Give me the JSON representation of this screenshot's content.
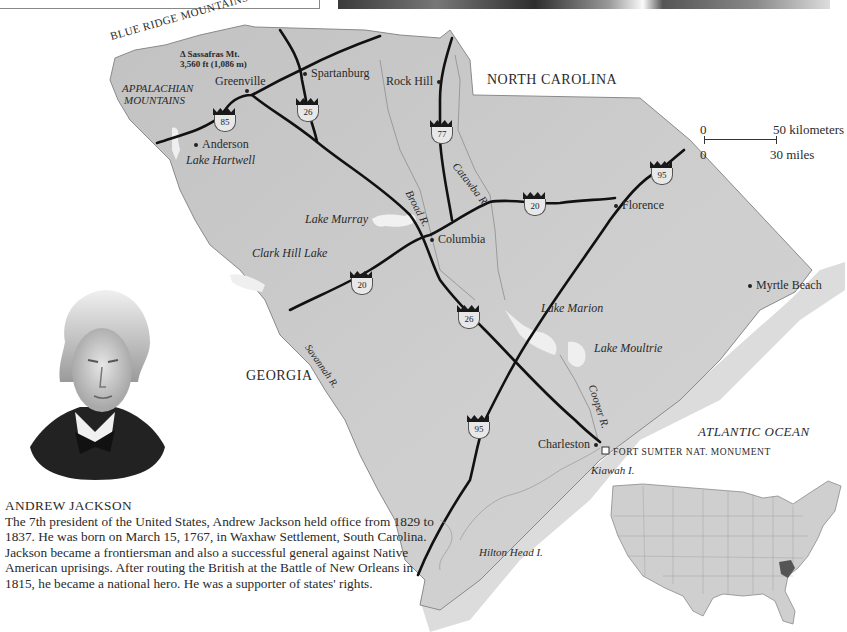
{
  "page": {
    "type": "atlas-map-page",
    "subject": "South Carolina"
  },
  "map": {
    "regions": {
      "north_carolina": "NORTH CAROLINA",
      "georgia": "GEORGIA",
      "atlantic_ocean": "ATLANTIC OCEAN"
    },
    "mountains": {
      "blue_ridge": "BLUE RIDGE MOUNTAINS",
      "appalachian_line1": "APPALACHIAN",
      "appalachian_line2": "MOUNTAINS",
      "peak_line1": "Δ Sassafras Mt.",
      "peak_line2": "3,560 ft (1,086 m)"
    },
    "cities": [
      {
        "name": "Greenville"
      },
      {
        "name": "Spartanburg"
      },
      {
        "name": "Rock Hill"
      },
      {
        "name": "Anderson"
      },
      {
        "name": "Columbia",
        "capital": true
      },
      {
        "name": "Florence"
      },
      {
        "name": "Myrtle Beach"
      },
      {
        "name": "Charleston"
      }
    ],
    "water": {
      "lake_hartwell": "Lake Hartwell",
      "lake_murray": "Lake Murray",
      "clark_hill_lake": "Clark Hill Lake",
      "lake_marion": "Lake Marion",
      "lake_moultrie": "Lake Moultrie",
      "catawba_river": "Catawba R.",
      "broad_river": "Broad R.",
      "savannah_river": "Savannah R.",
      "cooper_river": "Cooper R."
    },
    "islands": {
      "kiawah": "Kiawah I.",
      "hilton_head": "Hilton Head I."
    },
    "landmarks": {
      "fort_sumter": "FORT SUMTER NAT. MONUMENT"
    },
    "interstates": [
      {
        "id": "i85",
        "number": "85"
      },
      {
        "id": "i26a",
        "number": "26"
      },
      {
        "id": "i77",
        "number": "77"
      },
      {
        "id": "i95a",
        "number": "95"
      },
      {
        "id": "i20a",
        "number": "20"
      },
      {
        "id": "i20b",
        "number": "20"
      },
      {
        "id": "i26b",
        "number": "26"
      },
      {
        "id": "i95b",
        "number": "95"
      }
    ],
    "scale": {
      "km_zero": "0",
      "km_label": "50 kilometers",
      "mi_zero": "0",
      "mi_label": "30 miles"
    },
    "colors": {
      "land": "#c9c9c9",
      "land_light": "#d6d6d6",
      "coast_shelf": "#dcdcdc",
      "highway": "#111111",
      "water": "#f1f1f1",
      "sc_highlight": "#555555"
    }
  },
  "caption": {
    "title": "ANDREW JACKSON",
    "body": "The 7th president of the United States, Andrew Jackson held office from 1829 to 1837. He was born on March 15, 1767, in Waxhaw Settlement, South Carolina. Jackson became a frontiersman and also a successful general against Native American uprisings. After routing the British at the Battle of New Orleans in 1815, he became a national hero. He was a supporter of states' rights."
  },
  "inset": {
    "label": "United States locator map with South Carolina highlighted"
  }
}
